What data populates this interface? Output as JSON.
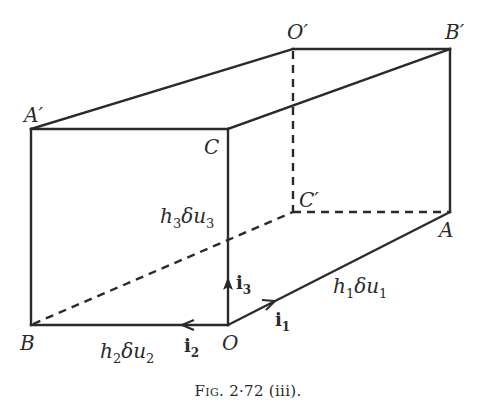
{
  "figure": {
    "caption_prefix": "Fig.",
    "caption_number": "2·72 (iii).",
    "vertices": {
      "A_prime": {
        "label": "A′",
        "x": 31,
        "y": 129
      },
      "C": {
        "label": "C",
        "x": 228,
        "y": 129
      },
      "B": {
        "label": "B",
        "x": 31,
        "y": 325
      },
      "O": {
        "label": "O",
        "x": 228,
        "y": 325
      },
      "O_prime": {
        "label": "O′",
        "x": 293,
        "y": 49
      },
      "B_prime": {
        "label": "B′",
        "x": 450,
        "y": 49
      },
      "C_prime": {
        "label": "C′",
        "x": 293,
        "y": 212
      },
      "A": {
        "label": "A",
        "x": 450,
        "y": 212
      }
    },
    "labels": {
      "A_prime": "A′",
      "C": "C",
      "B": "B",
      "O": "O",
      "O_prime": "O′",
      "B_prime": "B′",
      "C_prime": "C′",
      "A": "A"
    },
    "edge_lengths": {
      "h1": {
        "base": "h",
        "sub1": "1",
        "mid": "δu",
        "sub2": "1"
      },
      "h2": {
        "base": "h",
        "sub1": "2",
        "mid": "δu",
        "sub2": "2"
      },
      "h3": {
        "base": "h",
        "sub1": "3",
        "mid": "δu",
        "sub2": "3"
      }
    },
    "unit_vectors": {
      "i1": {
        "base": "i",
        "sub": "1"
      },
      "i2": {
        "base": "i",
        "sub": "2"
      },
      "i3": {
        "base": "i",
        "sub": "3"
      }
    },
    "line_color": "#2a2a2a",
    "background": "#ffffff"
  }
}
